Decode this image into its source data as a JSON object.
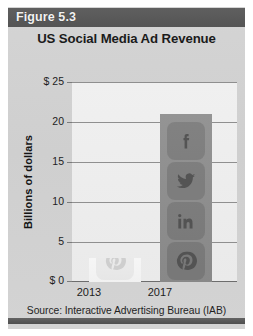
{
  "figure": {
    "header_label": "Figure 5.3",
    "title": "US Social Media Ad Revenue",
    "source": "Source: Interactive Advertising Bureau (IAB)"
  },
  "colors": {
    "header_band": "#595959",
    "panel_background": "#d2d2d2",
    "plot_background": "#eeeeee",
    "bar_2017": "#8d8d8d",
    "bar_2013": "#f4f4f4",
    "gridline": "#8f8f8f",
    "footer_rule": "#585858"
  },
  "icons": [
    {
      "name": "facebook-icon",
      "label": "f"
    },
    {
      "name": "twitter-icon",
      "label": "bird"
    },
    {
      "name": "linkedin-icon",
      "label": "in"
    },
    {
      "name": "pinterest-icon",
      "label": "p"
    }
  ],
  "chart_data": {
    "type": "bar",
    "title": "US Social Media Ad Revenue",
    "xlabel": "",
    "ylabel": "Billions of dollars",
    "categories": [
      "2013",
      "2017"
    ],
    "values": [
      3,
      21
    ],
    "ylim": [
      0,
      25
    ],
    "yticks": [
      0,
      5,
      10,
      15,
      20,
      25
    ],
    "ytick_labels": [
      "$ 0",
      "5",
      "10",
      "15",
      "20",
      "$ 25"
    ],
    "grid": true,
    "legend": false,
    "source": "Source: Interactive Advertising Bureau (IAB)"
  }
}
